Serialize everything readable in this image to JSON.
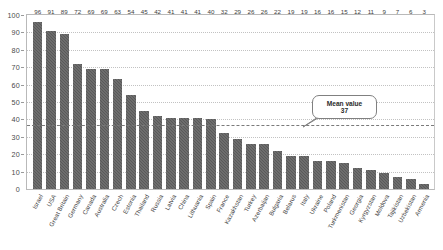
{
  "chart_data": {
    "type": "bar",
    "title": "",
    "xlabel": "",
    "ylabel": "",
    "ylim": [
      0,
      100
    ],
    "grid": true,
    "legend": "none",
    "y_ticks": [
      0,
      10,
      20,
      30,
      40,
      50,
      60,
      70,
      80,
      90,
      100
    ],
    "categories": [
      "Israel",
      "USA",
      "Great Britain",
      "Germany",
      "Canada",
      "Australia",
      "Czech",
      "Estonia",
      "Thailand",
      "Russia",
      "Latvia",
      "China",
      "Lithuania",
      "Spain",
      "France",
      "Kazakhstan",
      "Turkey",
      "Azerbaijan",
      "Bulgaria",
      "Belarus",
      "Italy",
      "Ukraine",
      "Poland",
      "Turkmenistan",
      "Georgia",
      "Kyrgyzstan",
      "Moldova",
      "Tajikistan",
      "Uzbekistan",
      "Armenia"
    ],
    "values": [
      96,
      91,
      89,
      72,
      69,
      69,
      63,
      54,
      45,
      42,
      41,
      41,
      41,
      40,
      32,
      29,
      26,
      26,
      22,
      19,
      19,
      16,
      16,
      15,
      12,
      11,
      9,
      7,
      6,
      3
    ],
    "annotations": [
      {
        "id": "mean-value",
        "title": "Mean value",
        "value": "37",
        "numeric": 37,
        "kind": "reference-line-callout"
      }
    ]
  },
  "colors": {
    "bar": "#595959",
    "grid": "#c2c2c2",
    "mean_line": "#7a7a7a",
    "axis": "#b9b9b9",
    "text": "#3d3d3d",
    "background": "#ffffff"
  }
}
